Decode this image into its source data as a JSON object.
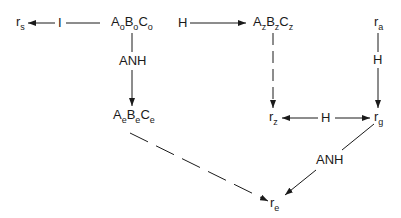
{
  "diagram": {
    "nodes": {
      "rs": {
        "base": "r",
        "sub": "s"
      },
      "ABCo": {
        "parts": [
          {
            "base": "A",
            "sub": "o"
          },
          {
            "base": "B",
            "sub": "o"
          },
          {
            "base": "C",
            "sub": "o"
          }
        ]
      },
      "ABCz": {
        "parts": [
          {
            "base": "A",
            "sub": "z"
          },
          {
            "base": "B",
            "sub": "z"
          },
          {
            "base": "C",
            "sub": "z"
          }
        ]
      },
      "ABCe": {
        "parts": [
          {
            "base": "A",
            "sub": "e"
          },
          {
            "base": "B",
            "sub": "e"
          },
          {
            "base": "C",
            "sub": "e"
          }
        ]
      },
      "ra": {
        "base": "r",
        "sub": "a"
      },
      "rz": {
        "base": "r",
        "sub": "z"
      },
      "rg": {
        "base": "r",
        "sub": "g"
      },
      "re": {
        "base": "r",
        "sub": "e"
      }
    },
    "edge_labels": {
      "o_to_rs": "I",
      "o_to_z": "H",
      "o_to_e": "ANH",
      "a_to_g": "H",
      "g_z_bidir": "H",
      "g_to_e": "ANH"
    },
    "edges": [
      {
        "from": "ABCo",
        "to": "rs",
        "label": "I",
        "style": "solid"
      },
      {
        "from": "ABCo",
        "to": "ABCz",
        "label": "H",
        "style": "solid"
      },
      {
        "from": "ABCo",
        "to": "ABCe",
        "label": "ANH",
        "style": "solid"
      },
      {
        "from": "ABCz",
        "to": "rz",
        "label": "",
        "style": "dashed"
      },
      {
        "from": "ra",
        "to": "rg",
        "label": "H",
        "style": "solid"
      },
      {
        "from": "rg",
        "to": "rz",
        "label": "H",
        "style": "solid",
        "bidirectional": true
      },
      {
        "from": "rg",
        "to": "re",
        "label": "ANH",
        "style": "solid"
      },
      {
        "from": "ABCe",
        "to": "re",
        "label": "",
        "style": "dashed"
      }
    ]
  }
}
